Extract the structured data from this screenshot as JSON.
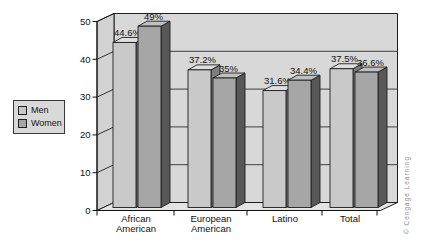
{
  "chart_data": {
    "type": "bar",
    "style": "3d-clustered-column",
    "title": "",
    "xlabel": "",
    "ylabel": "",
    "categories": [
      "African American",
      "European American",
      "Latino",
      "Total"
    ],
    "series": [
      {
        "name": "Men",
        "values": [
          44.6,
          37.2,
          31.6,
          37.5
        ],
        "display_labels": [
          "44.6%",
          "37.2%",
          "31.6%",
          "37.5%"
        ],
        "colors": {
          "front": "#c9c9c9",
          "top": "#dedede",
          "side": "#7d7d7d"
        }
      },
      {
        "name": "Women",
        "values": [
          49,
          35,
          34.4,
          36.6
        ],
        "display_labels": [
          "49%",
          "35%",
          "34.4%",
          "36.6%"
        ],
        "colors": {
          "front": "#a6a6a6",
          "top": "#c0c0c0",
          "side": "#585858"
        }
      }
    ],
    "ylim": [
      0,
      50
    ],
    "y_ticks": [
      0,
      10,
      20,
      30,
      40,
      50
    ],
    "grid": true,
    "legend_position": "left"
  },
  "legend": {
    "items": [
      "Men",
      "Women"
    ]
  },
  "credit": "© Cengage Learning",
  "colors": {
    "background": "#ffffff",
    "back_wall": "#d8d8d8",
    "left_wall": "#d2d2d2",
    "floor": "#e3e3e3",
    "gridline": "#3f3f3f",
    "outline": "#1f1f1f",
    "axis": "#111111",
    "text": "#111111",
    "credit_text": "#8a8a8a"
  }
}
